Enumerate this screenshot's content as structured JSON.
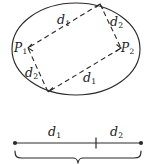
{
  "figure": {
    "name": "ellipse-parallelogram-distance-figure",
    "stroke_color": "#2b2b2b",
    "label_color": "#1a1a1a",
    "background": "#ffffff",
    "ellipse": {
      "center_x": 76,
      "center_y": 49,
      "radius_x": 64,
      "radius_y": 46
    },
    "parallelogram": {
      "style": "dashed",
      "vertices": [
        {
          "name": "top-vertex",
          "x": 100,
          "y": 4
        },
        {
          "name": "right-vertex-p2",
          "x": 121,
          "y": 48
        },
        {
          "name": "bottom-vertex",
          "x": 48,
          "y": 92
        },
        {
          "name": "left-vertex-p1",
          "x": 28,
          "y": 48
        }
      ]
    },
    "side_labels": [
      {
        "name": "side-label-top-d1",
        "base": "d",
        "sub": "1",
        "x": 57,
        "y": 14
      },
      {
        "name": "side-label-right-d2",
        "base": "d",
        "sub": "2",
        "x": 110,
        "y": 16
      },
      {
        "name": "side-label-left-d2",
        "base": "d",
        "sub": "2",
        "x": 25,
        "y": 67
      },
      {
        "name": "side-label-bottom-d1",
        "base": "d",
        "sub": "1",
        "x": 83,
        "y": 72
      }
    ],
    "point_labels": [
      {
        "name": "point-label-p1",
        "base": "P",
        "sub": "1",
        "x": 14,
        "y": 42
      },
      {
        "name": "point-label-p2",
        "base": "P",
        "sub": "2",
        "x": 121,
        "y": 42
      }
    ],
    "segment": {
      "name": "divided-segment",
      "left_x": 15,
      "right_x": 141,
      "y": 143,
      "tick_x": 96,
      "endpoint_dot_radius": 2.1,
      "labels": [
        {
          "name": "segment-label-d1",
          "base": "d",
          "sub": "1",
          "x": 48,
          "y": 126
        },
        {
          "name": "segment-label-d2",
          "base": "d",
          "sub": "2",
          "x": 110,
          "y": 126
        }
      ],
      "brace": {
        "name": "total-length-brace",
        "left_x": 15,
        "right_x": 141,
        "top_y": 152,
        "depth_y": 160
      }
    }
  }
}
